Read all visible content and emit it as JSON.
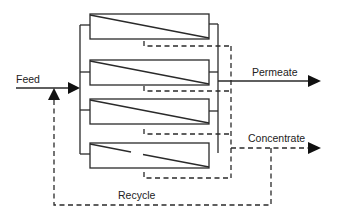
{
  "diagram": {
    "type": "membrane-modules-parallel-with-recycle",
    "labels": {
      "feed": "Feed",
      "permeate": "Permeate",
      "concentrate": "Concentrate",
      "recycle": "Recycle"
    },
    "modules": [
      {
        "id": "module-1",
        "broken_membrane": false
      },
      {
        "id": "module-2",
        "broken_membrane": false
      },
      {
        "id": "module-3",
        "broken_membrane": false
      },
      {
        "id": "module-4",
        "broken_membrane": true
      }
    ],
    "colors": {
      "line": "#2a2a2a",
      "background": "#ffffff"
    }
  }
}
